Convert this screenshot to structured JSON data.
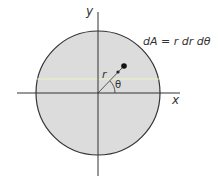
{
  "diagram": {
    "labels": {
      "x_axis": "x",
      "y_axis": "y",
      "radius": "r",
      "angle": "θ",
      "equation": "dA = r dr dθ"
    },
    "colors": {
      "disk_fill": "#dcdcdc",
      "outline": "#333333",
      "axis": "#333333",
      "scan_line": "#eef0c8",
      "background": "#ffffff"
    },
    "geometry": {
      "origin": [
        98,
        93
      ],
      "disk_radius": 62,
      "point": [
        124,
        66
      ]
    }
  }
}
